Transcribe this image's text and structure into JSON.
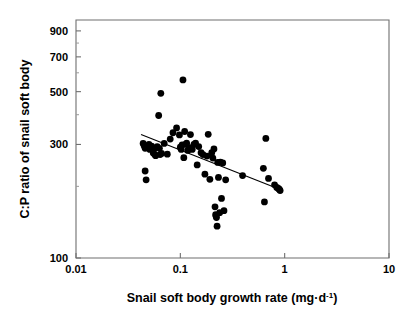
{
  "chart_data": {
    "type": "scatter",
    "title": "",
    "xlabel": "Snail soft body growth rate (mg·d⁻¹)",
    "ylabel": "C:P ratio of snail soft body",
    "xlabel_parts": {
      "main": "Snail soft body growth rate (mg",
      "dot": "·",
      "unit": "d",
      "exponent": "-1",
      "close": ")"
    },
    "xscale": "log",
    "yscale": "log",
    "xlim": [
      0.01,
      10
    ],
    "ylim": [
      100,
      1000
    ],
    "grid": false,
    "legend": null,
    "xticks": [
      {
        "value": 0.01,
        "label": "0.01"
      },
      {
        "value": 0.1,
        "label": "0.1"
      },
      {
        "value": 1,
        "label": "1"
      },
      {
        "value": 10,
        "label": "10"
      }
    ],
    "yticks": [
      {
        "value": 100,
        "label": "100"
      },
      {
        "value": 300,
        "label": "300"
      },
      {
        "value": 500,
        "label": "500"
      },
      {
        "value": 700,
        "label": "700"
      },
      {
        "value": 900,
        "label": "900"
      }
    ],
    "yticks_minor": [
      200,
      400,
      600,
      800
    ],
    "marker": {
      "shape": "circle",
      "color": "#000000",
      "size_px": 4.2
    },
    "regression_line": {
      "color": "#000000",
      "x_start": 0.042,
      "y_start": 330,
      "x_end": 0.93,
      "y_end": 193
    },
    "points": [
      {
        "x": 0.044,
        "y": 303
      },
      {
        "x": 0.045,
        "y": 296
      },
      {
        "x": 0.046,
        "y": 289
      },
      {
        "x": 0.046,
        "y": 232
      },
      {
        "x": 0.047,
        "y": 213
      },
      {
        "x": 0.05,
        "y": 300
      },
      {
        "x": 0.051,
        "y": 286
      },
      {
        "x": 0.053,
        "y": 295
      },
      {
        "x": 0.055,
        "y": 276
      },
      {
        "x": 0.056,
        "y": 287
      },
      {
        "x": 0.057,
        "y": 272
      },
      {
        "x": 0.058,
        "y": 269
      },
      {
        "x": 0.06,
        "y": 294
      },
      {
        "x": 0.062,
        "y": 397
      },
      {
        "x": 0.063,
        "y": 289
      },
      {
        "x": 0.064,
        "y": 272
      },
      {
        "x": 0.065,
        "y": 492
      },
      {
        "x": 0.066,
        "y": 275
      },
      {
        "x": 0.07,
        "y": 303
      },
      {
        "x": 0.075,
        "y": 273
      },
      {
        "x": 0.08,
        "y": 316
      },
      {
        "x": 0.085,
        "y": 336
      },
      {
        "x": 0.092,
        "y": 352
      },
      {
        "x": 0.098,
        "y": 329
      },
      {
        "x": 0.1,
        "y": 292
      },
      {
        "x": 0.102,
        "y": 286
      },
      {
        "x": 0.104,
        "y": 299
      },
      {
        "x": 0.106,
        "y": 560
      },
      {
        "x": 0.108,
        "y": 264
      },
      {
        "x": 0.11,
        "y": 340
      },
      {
        "x": 0.112,
        "y": 300
      },
      {
        "x": 0.115,
        "y": 304
      },
      {
        "x": 0.118,
        "y": 283
      },
      {
        "x": 0.122,
        "y": 291
      },
      {
        "x": 0.125,
        "y": 330
      },
      {
        "x": 0.13,
        "y": 286
      },
      {
        "x": 0.135,
        "y": 300
      },
      {
        "x": 0.14,
        "y": 304
      },
      {
        "x": 0.145,
        "y": 246
      },
      {
        "x": 0.15,
        "y": 294
      },
      {
        "x": 0.158,
        "y": 277
      },
      {
        "x": 0.165,
        "y": 272
      },
      {
        "x": 0.172,
        "y": 225
      },
      {
        "x": 0.18,
        "y": 268
      },
      {
        "x": 0.185,
        "y": 331
      },
      {
        "x": 0.192,
        "y": 214
      },
      {
        "x": 0.2,
        "y": 277
      },
      {
        "x": 0.205,
        "y": 263
      },
      {
        "x": 0.21,
        "y": 287
      },
      {
        "x": 0.215,
        "y": 164
      },
      {
        "x": 0.218,
        "y": 152
      },
      {
        "x": 0.22,
        "y": 150
      },
      {
        "x": 0.222,
        "y": 148
      },
      {
        "x": 0.225,
        "y": 136
      },
      {
        "x": 0.228,
        "y": 252
      },
      {
        "x": 0.232,
        "y": 218
      },
      {
        "x": 0.238,
        "y": 155
      },
      {
        "x": 0.242,
        "y": 253
      },
      {
        "x": 0.248,
        "y": 178
      },
      {
        "x": 0.255,
        "y": 251
      },
      {
        "x": 0.262,
        "y": 158
      },
      {
        "x": 0.272,
        "y": 213
      },
      {
        "x": 0.395,
        "y": 222
      },
      {
        "x": 0.625,
        "y": 238
      },
      {
        "x": 0.64,
        "y": 172
      },
      {
        "x": 0.66,
        "y": 318
      },
      {
        "x": 0.7,
        "y": 216
      },
      {
        "x": 0.8,
        "y": 203
      },
      {
        "x": 0.84,
        "y": 198
      },
      {
        "x": 0.87,
        "y": 196
      },
      {
        "x": 0.89,
        "y": 194
      },
      {
        "x": 0.905,
        "y": 192
      }
    ]
  }
}
